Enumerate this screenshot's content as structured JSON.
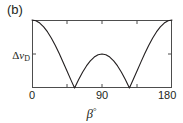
{
  "panel": {
    "label": "(b)"
  },
  "axes": {
    "ylabel_delta": "Δ",
    "ylabel_var": "ν",
    "ylabel_sub": "D",
    "xlabel_var": "β",
    "xlabel_unit": "°",
    "xtick_labels": [
      "0",
      "90",
      "180"
    ]
  },
  "style": {
    "frame_color": "#4d4d4d",
    "curve_color": "#231f20",
    "text_color": "#231f20",
    "background": "#ffffff"
  },
  "chart_data": {
    "type": "line",
    "title": "(b)",
    "xlabel": "β°",
    "ylabel": "Δν_D",
    "xlim": [
      0,
      180
    ],
    "ylim": [
      0,
      1
    ],
    "grid": false,
    "legend": "none",
    "xticks": [
      0,
      45,
      90,
      135,
      180
    ],
    "xticklabels": [
      "0",
      "",
      "90",
      "",
      "180"
    ],
    "yticks": [
      0.5
    ],
    "yticklabels": [
      "Δν_D"
    ],
    "annotations": [
      "zero crossing (cusp) near β = 54.7°",
      "zero crossing (cusp) near β = 125.3°",
      "local maximum at β = 90° reaching half of peak",
      "maxima at β = 0° and β = 180°"
    ],
    "series": [
      {
        "name": "|(3cos²β − 1)/2|",
        "x": [
          0,
          5,
          10,
          15,
          20,
          25,
          30,
          35,
          40,
          45,
          50,
          54.7356,
          60,
          65,
          70,
          75,
          80,
          85,
          90,
          95,
          100,
          105,
          110,
          115,
          120,
          125.2644,
          130,
          135,
          140,
          145,
          150,
          155,
          160,
          165,
          170,
          175,
          180
        ],
        "y": [
          1.0,
          0.9886,
          0.9548,
          0.8995,
          0.8245,
          0.7321,
          0.625,
          0.5065,
          0.3802,
          0.25,
          0.1198,
          0.0,
          0.125,
          0.2321,
          0.3245,
          0.4,
          0.4548,
          0.4886,
          0.5,
          0.4886,
          0.4548,
          0.4,
          0.3245,
          0.2321,
          0.125,
          0.0,
          0.1198,
          0.25,
          0.3802,
          0.5065,
          0.625,
          0.7321,
          0.8245,
          0.8995,
          0.9548,
          0.9886,
          1.0
        ]
      }
    ]
  }
}
